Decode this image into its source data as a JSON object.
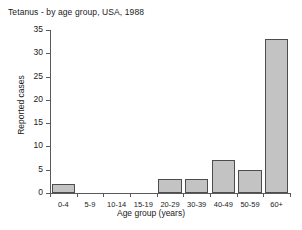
{
  "chart_data": {
    "type": "bar",
    "title": "Tetanus - by age group, USA, 1988",
    "xlabel": "Age group (years)",
    "ylabel": "Reported cases",
    "categories": [
      "0-4",
      "5-9",
      "10-14",
      "15-19",
      "20-29",
      "30-39",
      "40-49",
      "50-59",
      "60+"
    ],
    "values": [
      2,
      0,
      0,
      0,
      3,
      3,
      7,
      5,
      33
    ],
    "ylim": [
      0,
      35
    ],
    "yticks": [
      0,
      5,
      10,
      15,
      20,
      25,
      30,
      35
    ],
    "ytick_labels": [
      "0",
      "5",
      "10",
      "15",
      "20",
      "25",
      "30",
      "35"
    ],
    "grid": false,
    "legend": null,
    "bar_color": "#c3c3c3",
    "bar_edge_color": "#4d4d4d",
    "axis_color": "#5a5a5a",
    "background_color": "#ffffff"
  }
}
